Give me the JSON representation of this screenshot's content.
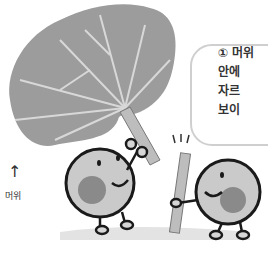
{
  "illustration": {
    "description": "Two cartoon round characters holding a butterbur (머위) leaf stalk; speech bubble explaining cross-section",
    "speech_bubble": {
      "number": "①",
      "lines": [
        "머위",
        "안에",
        "자르",
        "보이"
      ]
    },
    "left_label": {
      "arrow": "↑",
      "text": "머위"
    }
  },
  "colors": {
    "leaf": "#9a9a9a",
    "leaf_vein": "#d8d8d8",
    "character": "#c9c9c9",
    "outline": "#1a1a1a",
    "bubble_border": "#cfcfcf"
  }
}
